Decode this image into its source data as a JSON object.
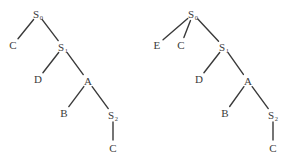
{
  "figure": {
    "title": "",
    "background_color": "#ffffff",
    "line_color": "#3a3a3a",
    "text_color": "#3a3a3a",
    "width": 291,
    "height": 166
  },
  "trees": [
    {
      "id": "left-parse-tree",
      "name": "left-tree",
      "nodes": [
        {
          "id": "L-S0",
          "label": "S",
          "sub": "0",
          "x": 38,
          "y": 14
        },
        {
          "id": "L-C1",
          "label": "C",
          "sub": "",
          "x": 13,
          "y": 45
        },
        {
          "id": "L-S1",
          "label": "S",
          "sub": "1",
          "x": 63,
          "y": 47
        },
        {
          "id": "L-D",
          "label": "D",
          "sub": "",
          "x": 38,
          "y": 79
        },
        {
          "id": "L-A",
          "label": "A",
          "sub": "",
          "x": 88,
          "y": 81
        },
        {
          "id": "L-B",
          "label": "B",
          "sub": "",
          "x": 64,
          "y": 113
        },
        {
          "id": "L-S2",
          "label": "S",
          "sub": "2",
          "x": 113,
          "y": 115
        },
        {
          "id": "L-C2",
          "label": "C",
          "sub": "",
          "x": 113,
          "y": 148
        }
      ],
      "edges": [
        {
          "from": "L-S0",
          "to": "L-C1"
        },
        {
          "from": "L-S0",
          "to": "L-S1"
        },
        {
          "from": "L-S1",
          "to": "L-D"
        },
        {
          "from": "L-S1",
          "to": "L-A"
        },
        {
          "from": "L-A",
          "to": "L-B"
        },
        {
          "from": "L-A",
          "to": "L-S2"
        },
        {
          "from": "L-S2",
          "to": "L-C2"
        }
      ]
    },
    {
      "id": "right-parse-tree",
      "name": "right-tree",
      "nodes": [
        {
          "id": "R-S0",
          "label": "S",
          "sub": "0",
          "x": 193,
          "y": 14
        },
        {
          "id": "R-E",
          "label": "E",
          "sub": "",
          "x": 157,
          "y": 45
        },
        {
          "id": "R-C1",
          "label": "C",
          "sub": "",
          "x": 181,
          "y": 45
        },
        {
          "id": "R-S1",
          "label": "S",
          "sub": "1",
          "x": 224,
          "y": 47
        },
        {
          "id": "R-D",
          "label": "D",
          "sub": "",
          "x": 199,
          "y": 79
        },
        {
          "id": "R-A",
          "label": "A",
          "sub": "",
          "x": 248,
          "y": 81
        },
        {
          "id": "R-B",
          "label": "B",
          "sub": "",
          "x": 225,
          "y": 113
        },
        {
          "id": "R-S2",
          "label": "S",
          "sub": "2",
          "x": 273,
          "y": 115
        },
        {
          "id": "R-C2",
          "label": "C",
          "sub": "",
          "x": 273,
          "y": 148
        }
      ],
      "edges": [
        {
          "from": "R-S0",
          "to": "R-E"
        },
        {
          "from": "R-S0",
          "to": "R-C1"
        },
        {
          "from": "R-S0",
          "to": "R-S1"
        },
        {
          "from": "R-S1",
          "to": "R-D"
        },
        {
          "from": "R-S1",
          "to": "R-A"
        },
        {
          "from": "R-A",
          "to": "R-B"
        },
        {
          "from": "R-A",
          "to": "R-S2"
        },
        {
          "from": "R-S2",
          "to": "R-C2"
        }
      ]
    }
  ]
}
